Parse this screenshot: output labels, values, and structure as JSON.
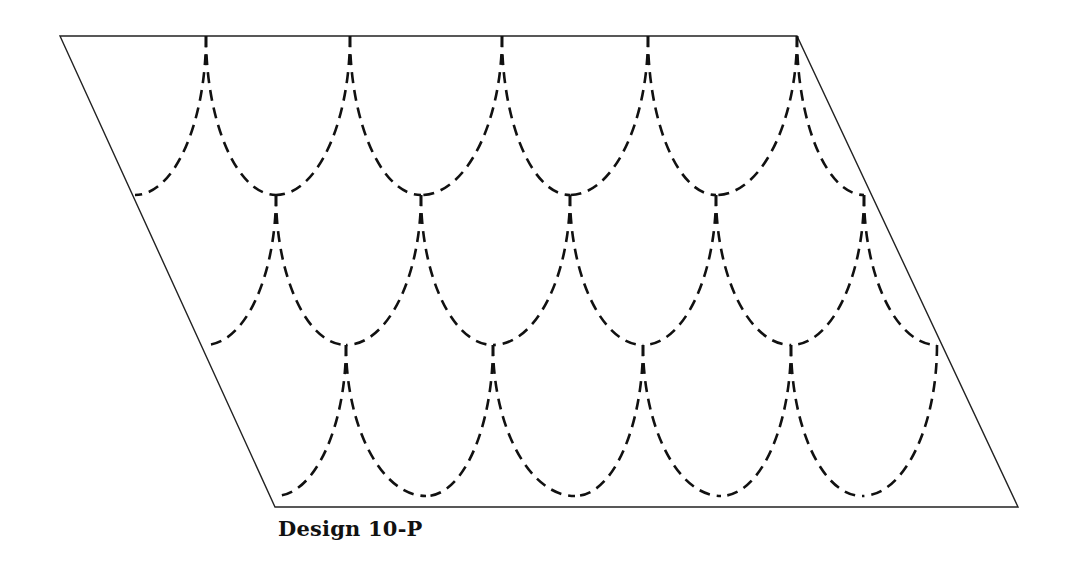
{
  "caption": "Design 10-P",
  "colors": {
    "line": "#111111",
    "background": "#ffffff"
  },
  "frame": {
    "shape": "parallelogram",
    "points": [
      [
        60,
        36
      ],
      [
        797,
        36
      ],
      [
        1018,
        507
      ],
      [
        275,
        507
      ]
    ]
  },
  "rows": [
    {
      "top_y": 36,
      "bottom_y": 195,
      "cusps": [
        206,
        350,
        502,
        648,
        797
      ],
      "bottoms": [
        135,
        276,
        421,
        570,
        716,
        864
      ]
    },
    {
      "top_y": 195,
      "bottom_y": 345,
      "cusps": [
        276,
        421,
        570,
        716,
        864
      ],
      "bottoms": [
        205,
        346,
        493,
        643,
        791,
        937
      ]
    },
    {
      "top_y": 345,
      "bottom_y": 496,
      "cusps": [
        346,
        493,
        643,
        791,
        937
      ],
      "bottoms": [
        275,
        426,
        575,
        721,
        862
      ]
    }
  ]
}
